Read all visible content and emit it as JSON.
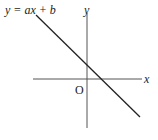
{
  "diagram": {
    "type": "coordinate-plane-line",
    "equation_label": "y = ax + b",
    "x_axis_label": "x",
    "y_axis_label": "y",
    "origin_label": "O",
    "line": {
      "slope_sign": "negative",
      "y_intercept_sign": "positive",
      "x_intercept_sign": "positive"
    },
    "colors": {
      "axes": "#555555",
      "line": "#222222",
      "text": "#222222",
      "background": "#ffffff"
    }
  }
}
